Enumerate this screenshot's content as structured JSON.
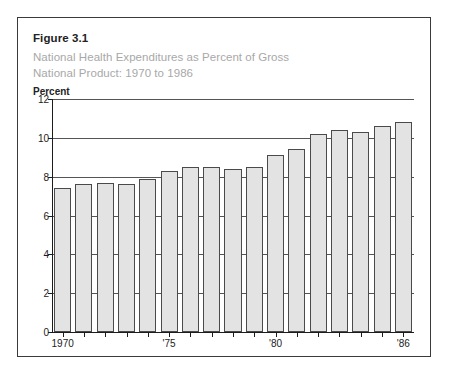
{
  "figure": {
    "label": "Figure 3.1",
    "subtitle_line1": "National Health Expenditures as Percent of Gross",
    "subtitle_line2": "National Product: 1970 to 1986",
    "unit_label": "Percent"
  },
  "colors": {
    "bar_fill": "#e3e3e3",
    "bar_stroke": "#4a4a4a",
    "gridline": "#555555",
    "axis": "#1c1c1c",
    "subtitle_text": "#a8a8a8",
    "frame": "#3a3a3a"
  },
  "chart_data": {
    "type": "bar",
    "title": "National Health Expenditures as Percent of Gross National Product: 1970 to 1986",
    "xlabel": "",
    "ylabel": "Percent",
    "ylim": [
      0,
      12
    ],
    "yticks": [
      0,
      2,
      4,
      6,
      8,
      10,
      12
    ],
    "ytick_labels": [
      "0",
      "2",
      "4",
      "6",
      "8",
      "10",
      "12"
    ],
    "grid": true,
    "legend": "none",
    "categories": [
      1970,
      1971,
      1972,
      1973,
      1974,
      1975,
      1976,
      1977,
      1978,
      1979,
      1980,
      1981,
      1982,
      1983,
      1984,
      1985,
      1986
    ],
    "xtick_positions": [
      1970,
      1975,
      1980,
      1986
    ],
    "xtick_labels": [
      "1970",
      "'75",
      "'80",
      "'86"
    ],
    "values": [
      7.4,
      7.6,
      7.7,
      7.6,
      7.9,
      8.3,
      8.5,
      8.5,
      8.4,
      8.5,
      9.1,
      9.4,
      10.2,
      10.4,
      10.3,
      10.6,
      10.8
    ]
  }
}
